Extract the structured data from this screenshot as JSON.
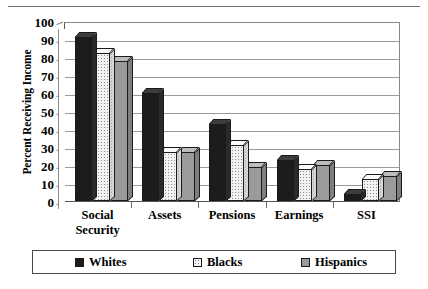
{
  "chart_data": {
    "type": "bar",
    "title": "",
    "xlabel": "",
    "ylabel": "Percent Receiving Income",
    "ylim": [
      0,
      100
    ],
    "yticks": [
      0,
      10,
      20,
      30,
      40,
      50,
      60,
      70,
      80,
      90,
      100
    ],
    "grid": true,
    "legend_position": "bottom",
    "categories": [
      "Social\nSecurity",
      "Assets",
      "Pensions",
      "Earnings",
      "SSI"
    ],
    "series": [
      {
        "name": "Whites",
        "color": "#1c1c1c",
        "values": [
          91,
          60,
          43,
          23,
          4
        ]
      },
      {
        "name": "Blacks",
        "color": "#f2f2f2",
        "values": [
          82,
          27,
          31,
          18,
          12
        ]
      },
      {
        "name": "Hispanics",
        "color": "#9b9b9b",
        "values": [
          78,
          27,
          19,
          20,
          14
        ]
      }
    ]
  },
  "axis": {
    "tick_100": "100",
    "tick_90": "90",
    "tick_80": "80",
    "tick_70": "70",
    "tick_60": "60",
    "tick_50": "50",
    "tick_40": "40",
    "tick_30": "30",
    "tick_20": "20",
    "tick_10": "10",
    "tick_0": "0"
  },
  "legend": {
    "items": [
      {
        "label": "Whites"
      },
      {
        "label": "Blacks"
      },
      {
        "label": "Hispanics"
      }
    ]
  }
}
